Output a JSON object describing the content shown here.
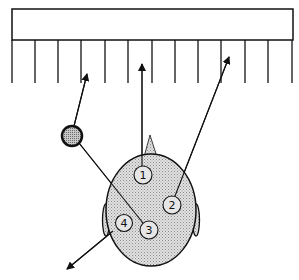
{
  "diagram": {
    "colors": {
      "stroke": "#111111",
      "head_fill": "#d4d4d4",
      "ball_fill": "#b8b8b8",
      "background": "#ffffff"
    },
    "wall": {
      "x": 12,
      "y": 9,
      "width": 281,
      "height": 31,
      "slat_bottom": 83,
      "slat_xs": [
        12,
        35,
        58,
        81,
        105,
        128,
        152,
        175,
        198,
        221,
        245,
        268,
        292
      ]
    },
    "head": {
      "cx": 151,
      "cy": 210,
      "rx": 45,
      "ry": 56,
      "nose": {
        "apex": [
          150,
          135
        ],
        "left": [
          144,
          157
        ],
        "right": [
          157,
          157
        ]
      },
      "ears": [
        {
          "side": "left",
          "cx": 106,
          "cy": 220,
          "rx": 3.5,
          "ry": 16
        },
        {
          "side": "right",
          "cx": 196,
          "cy": 220,
          "rx": 3.5,
          "ry": 16
        }
      ]
    },
    "ball": {
      "cx": 72,
      "cy": 136,
      "r": 10
    },
    "markers": [
      {
        "id": 1,
        "label": "①",
        "text": "1",
        "cx": 143,
        "cy": 175,
        "r": 9
      },
      {
        "id": 2,
        "label": "②",
        "text": "2",
        "cx": 172,
        "cy": 205,
        "r": 9
      },
      {
        "id": 3,
        "label": "③",
        "text": "3",
        "cx": 149,
        "cy": 230,
        "r": 9
      },
      {
        "id": 4,
        "label": "④",
        "text": "4",
        "cx": 124,
        "cy": 223,
        "r": 8.5
      }
    ],
    "arrows": [
      {
        "name": "arrow-from-1",
        "from": [
          142,
          166
        ],
        "to": [
          142,
          64
        ]
      },
      {
        "name": "arrow-from-2",
        "from": [
          175,
          196
        ],
        "to": [
          229,
          57
        ]
      },
      {
        "name": "arrow-from-ball",
        "from": [
          74,
          126
        ],
        "to": [
          87,
          74
        ]
      },
      {
        "name": "arrow-from-4",
        "from": [
          113,
          231
        ],
        "to": [
          67,
          269
        ]
      }
    ],
    "lines": [
      {
        "name": "line-ball-to-3",
        "from": [
          79,
          143
        ],
        "to": [
          143,
          223
        ]
      }
    ]
  }
}
